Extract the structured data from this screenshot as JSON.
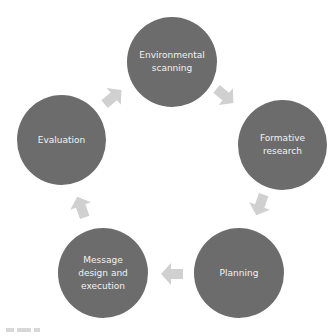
{
  "diagram": {
    "type": "cycle",
    "colors": {
      "node_fill": "#6c6c6c",
      "node_text": "#f2f2f2",
      "arrow_fill": "#d0d0d0",
      "background": "#ffffff"
    },
    "nodes": [
      {
        "id": "environmental-scanning",
        "label": "Environmental scanning"
      },
      {
        "id": "formative-research",
        "label": "Formative research"
      },
      {
        "id": "planning",
        "label": "Planning"
      },
      {
        "id": "message-design-execution",
        "label": "Message design and execution"
      },
      {
        "id": "evaluation",
        "label": "Evaluation"
      }
    ],
    "arrows": [
      {
        "from": "environmental-scanning",
        "to": "formative-research",
        "icon": "arrow-right-down-icon"
      },
      {
        "from": "formative-research",
        "to": "planning",
        "icon": "arrow-down-icon"
      },
      {
        "from": "planning",
        "to": "message-design-execution",
        "icon": "arrow-left-icon"
      },
      {
        "from": "message-design-execution",
        "to": "evaluation",
        "icon": "arrow-up-icon"
      },
      {
        "from": "evaluation",
        "to": "environmental-scanning",
        "icon": "arrow-right-up-icon"
      }
    ]
  }
}
